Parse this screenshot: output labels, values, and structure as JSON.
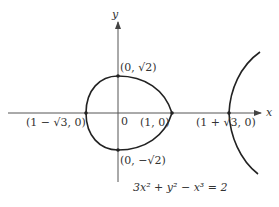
{
  "diagram": {
    "equation": "3x² + y² − x³ = 2",
    "axes": {
      "x_label": "x",
      "y_label": "y",
      "origin_label": "0"
    },
    "points": [
      {
        "label": "(0, √2)"
      },
      {
        "label": "(1 − √3, 0)"
      },
      {
        "label": "(1, 0)"
      },
      {
        "label": "(1 + √3, 0)"
      },
      {
        "label": "(0, −√2)"
      }
    ],
    "colors": {
      "curve": "#222222",
      "axis": "#444444",
      "text": "#333333"
    }
  }
}
